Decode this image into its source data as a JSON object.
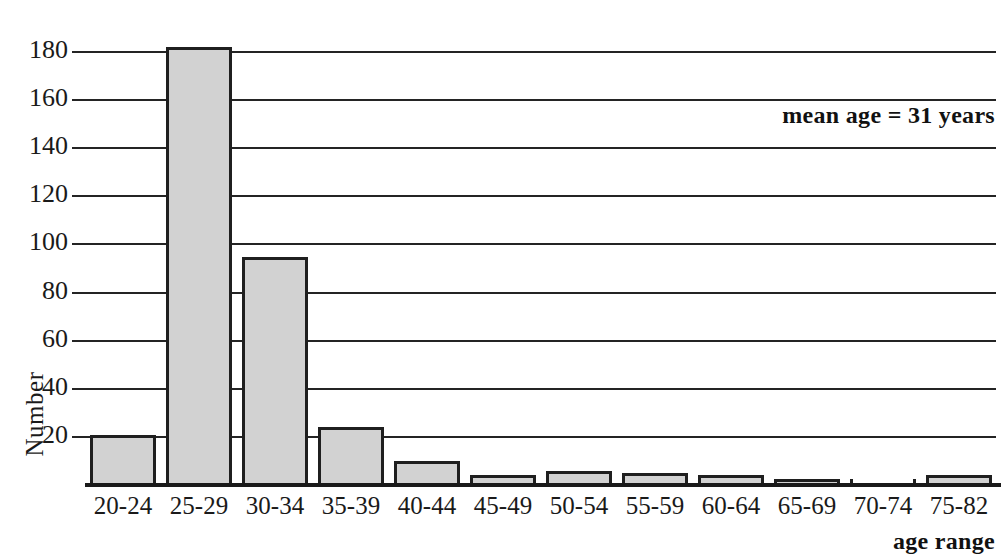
{
  "chart_data": {
    "type": "bar",
    "title": "",
    "xlabel": "age range",
    "ylabel": "Number",
    "categories": [
      "20-24",
      "25-29",
      "30-34",
      "35-39",
      "40-44",
      "45-49",
      "50-54",
      "55-59",
      "60-64",
      "65-69",
      "70-74",
      "75-82"
    ],
    "values": [
      21,
      182,
      95,
      24,
      10,
      4,
      6,
      5,
      4,
      2,
      0,
      4
    ],
    "ylim": [
      0,
      190
    ],
    "yticks": [
      20,
      40,
      60,
      80,
      100,
      120,
      140,
      160,
      180
    ],
    "ytick_labels": [
      "20",
      "40",
      "60",
      "80",
      "100",
      "120",
      "140",
      "160",
      "180"
    ],
    "grid": true,
    "legend": "none",
    "annotations": [
      {
        "text": "mean age = 31 years",
        "position": "top-right"
      }
    ],
    "bar_fill_color": "#d2d2d2",
    "bar_edge_color": "#1f1f1f",
    "axis_color": "#242424"
  },
  "axis": {
    "y_title": "Number",
    "x_title": "age range"
  },
  "annotation": {
    "mean_age_text": "mean age = 31 years"
  }
}
